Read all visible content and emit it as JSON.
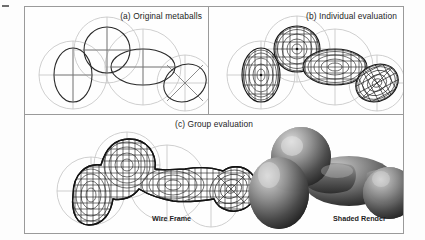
{
  "figure": {
    "kind": "scanned-figure",
    "background": "#fdfdfd",
    "frame_color": "#9a9a9a"
  },
  "panels": [
    {
      "id": "a",
      "caption": "(a) Original metaballs",
      "description": "Four metaball primitives shown as outline ellipses with crosshair axes and light gray field-influence circles; no surface is generated."
    },
    {
      "id": "b",
      "caption": "(b) Individual evaluation",
      "description": "Each metaball evaluated separately producing four independent wireframe meshed blobs that intersect but do not blend."
    },
    {
      "id": "c",
      "caption": "(c) Group evaluation",
      "description": "All metaballs evaluated as one implicit field producing a single blended wireframe surface, plus its shaded render."
    }
  ],
  "sublabels": {
    "wireframe": "Wire Frame",
    "shaded": "Shaded Render"
  },
  "colors": {
    "influence_circle": "#c6c6c6",
    "axis": "#6f6f6f",
    "primitive_outline": "#2a2a2a",
    "mesh": "#1a1a1a",
    "shade_light": "#d8d8d8",
    "shade_mid": "#8a8a8a",
    "shade_dark": "#2c2c2c"
  },
  "metaballs": [
    {
      "name": "tall-ellipse-left",
      "cx": 48,
      "cy": 68,
      "rx": 19,
      "ry": 27,
      "rot": 0,
      "influence_r": 34
    },
    {
      "name": "circle-top",
      "cx": 82,
      "cy": 43,
      "rx": 23,
      "ry": 23,
      "rot": 0,
      "influence_r": 33
    },
    {
      "name": "wide-ellipse-mid",
      "cx": 118,
      "cy": 60,
      "rx": 32,
      "ry": 18,
      "rot": 0,
      "influence_r": 38
    },
    {
      "name": "tilted-ellipse-right",
      "cx": 160,
      "cy": 76,
      "rx": 22,
      "ry": 18,
      "rot": -28,
      "influence_r": 28
    }
  ]
}
